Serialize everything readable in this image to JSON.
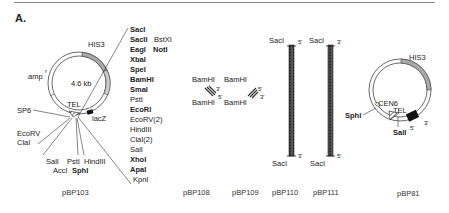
{
  "figure": {
    "panel_label": "A.",
    "plasmids": [
      {
        "name": "pBP103",
        "size_label": "4.6 kb",
        "features": [
          "HIS3",
          "amp",
          "TEL",
          "lacZ",
          "SP6"
        ],
        "amp_superscript": "r",
        "mcs_sites": [
          {
            "label": "SacI",
            "bold": true
          },
          {
            "label": "SacII",
            "bold": true,
            "extra": "BstXI"
          },
          {
            "label": "EagI",
            "bold": true,
            "extra": "NotI"
          },
          {
            "label": "XbaI",
            "bold": true
          },
          {
            "label": "SpeI",
            "bold": true
          },
          {
            "label": "BamHI",
            "bold": true
          },
          {
            "label": "SmaI",
            "bold": true
          },
          {
            "label": "PstI",
            "bold": false
          },
          {
            "label": "EcoRI",
            "bold": true
          },
          {
            "label": "EcoRV(2)",
            "bold": false
          },
          {
            "label": "HindIII",
            "bold": false
          },
          {
            "label": "ClaI(2)",
            "bold": false
          },
          {
            "label": "SalI",
            "bold": false
          },
          {
            "label": "XhoI",
            "bold": true
          },
          {
            "label": "ApaI",
            "bold": true
          },
          {
            "label": "KpnI",
            "bold": false
          }
        ],
        "left_sites": [
          "EcoRV",
          "ClaI"
        ],
        "bottom_sites_row1": [
          "SalI",
          "PstI",
          "HindIII"
        ],
        "bottom_sites_row2": [
          "AccI",
          "SphI"
        ]
      },
      {
        "name": "pBP108",
        "site_top": "BamHI",
        "site_bottom": "BamHI",
        "end_top": "3'",
        "end_bottom": "5'"
      },
      {
        "name": "pBP109",
        "site_top": "BamHI",
        "site_bottom": "BamHI",
        "end_top": "5'",
        "end_bottom": "3'"
      },
      {
        "name": "pBP110",
        "site_top": "SacI",
        "site_bottom": "SacI",
        "end_top": "5'",
        "end_bottom": "3'"
      },
      {
        "name": "pBP111",
        "site_top": "SacI",
        "site_bottom": "SacI",
        "end_top": "3'",
        "end_bottom": "5'"
      },
      {
        "name": "pBP81",
        "features": [
          "HIS3",
          "CEN6",
          "TEL"
        ],
        "sites": [
          "SphI",
          "SalI"
        ],
        "end_left": "5'",
        "end_right": "3'"
      }
    ]
  }
}
